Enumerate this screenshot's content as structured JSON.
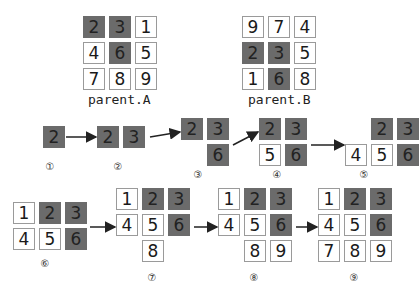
{
  "colors": {
    "highlight": "#6b6b6b",
    "plain": "#ffffff",
    "border": "#9a9a9a",
    "arrow": "#222222"
  },
  "parent_a": {
    "label": "parent.A",
    "grid": [
      [
        "2",
        "3",
        "1"
      ],
      [
        "4",
        "6",
        "5"
      ],
      [
        "7",
        "8",
        "9"
      ]
    ],
    "highlight": [
      [
        true,
        true,
        false
      ],
      [
        false,
        true,
        false
      ],
      [
        false,
        false,
        false
      ]
    ]
  },
  "parent_b": {
    "label": "parent.B",
    "grid": [
      [
        "9",
        "7",
        "4"
      ],
      [
        "2",
        "3",
        "5"
      ],
      [
        "1",
        "6",
        "8"
      ]
    ],
    "highlight": [
      [
        false,
        false,
        false
      ],
      [
        true,
        true,
        false
      ],
      [
        false,
        true,
        false
      ]
    ]
  },
  "steps": [
    {
      "marker": "①",
      "cells": [
        {
          "r": 0,
          "c": 0,
          "v": "2",
          "hl": true
        }
      ]
    },
    {
      "marker": "②",
      "cells": [
        {
          "r": 0,
          "c": 0,
          "v": "2",
          "hl": true
        },
        {
          "r": 0,
          "c": 1,
          "v": "3",
          "hl": true
        }
      ]
    },
    {
      "marker": "③",
      "cells": [
        {
          "r": 0,
          "c": 0,
          "v": "2",
          "hl": true
        },
        {
          "r": 0,
          "c": 1,
          "v": "3",
          "hl": true
        },
        {
          "r": 1,
          "c": 1,
          "v": "6",
          "hl": true
        }
      ]
    },
    {
      "marker": "④",
      "cells": [
        {
          "r": 0,
          "c": 0,
          "v": "2",
          "hl": true
        },
        {
          "r": 0,
          "c": 1,
          "v": "3",
          "hl": true
        },
        {
          "r": 1,
          "c": 0,
          "v": "5",
          "hl": false
        },
        {
          "r": 1,
          "c": 1,
          "v": "6",
          "hl": true
        }
      ]
    },
    {
      "marker": "⑤",
      "cells": [
        {
          "r": 0,
          "c": 1,
          "v": "2",
          "hl": true
        },
        {
          "r": 0,
          "c": 2,
          "v": "3",
          "hl": true
        },
        {
          "r": 1,
          "c": 0,
          "v": "4",
          "hl": false
        },
        {
          "r": 1,
          "c": 1,
          "v": "5",
          "hl": false
        },
        {
          "r": 1,
          "c": 2,
          "v": "6",
          "hl": true
        }
      ]
    },
    {
      "marker": "⑥",
      "cells": [
        {
          "r": 0,
          "c": 0,
          "v": "1",
          "hl": false
        },
        {
          "r": 0,
          "c": 1,
          "v": "2",
          "hl": true
        },
        {
          "r": 0,
          "c": 2,
          "v": "3",
          "hl": true
        },
        {
          "r": 1,
          "c": 0,
          "v": "4",
          "hl": false
        },
        {
          "r": 1,
          "c": 1,
          "v": "5",
          "hl": false
        },
        {
          "r": 1,
          "c": 2,
          "v": "6",
          "hl": true
        }
      ]
    },
    {
      "marker": "⑦",
      "cells": [
        {
          "r": 0,
          "c": 0,
          "v": "1",
          "hl": false
        },
        {
          "r": 0,
          "c": 1,
          "v": "2",
          "hl": true
        },
        {
          "r": 0,
          "c": 2,
          "v": "3",
          "hl": true
        },
        {
          "r": 1,
          "c": 0,
          "v": "4",
          "hl": false
        },
        {
          "r": 1,
          "c": 1,
          "v": "5",
          "hl": false
        },
        {
          "r": 1,
          "c": 2,
          "v": "6",
          "hl": true
        },
        {
          "r": 2,
          "c": 1,
          "v": "8",
          "hl": false
        }
      ]
    },
    {
      "marker": "⑧",
      "cells": [
        {
          "r": 0,
          "c": 0,
          "v": "1",
          "hl": false
        },
        {
          "r": 0,
          "c": 1,
          "v": "2",
          "hl": true
        },
        {
          "r": 0,
          "c": 2,
          "v": "3",
          "hl": true
        },
        {
          "r": 1,
          "c": 0,
          "v": "4",
          "hl": false
        },
        {
          "r": 1,
          "c": 1,
          "v": "5",
          "hl": false
        },
        {
          "r": 1,
          "c": 2,
          "v": "6",
          "hl": true
        },
        {
          "r": 2,
          "c": 1,
          "v": "8",
          "hl": false
        },
        {
          "r": 2,
          "c": 2,
          "v": "9",
          "hl": false
        }
      ]
    },
    {
      "marker": "⑨",
      "cells": [
        {
          "r": 0,
          "c": 0,
          "v": "1",
          "hl": false
        },
        {
          "r": 0,
          "c": 1,
          "v": "2",
          "hl": true
        },
        {
          "r": 0,
          "c": 2,
          "v": "3",
          "hl": true
        },
        {
          "r": 1,
          "c": 0,
          "v": "4",
          "hl": false
        },
        {
          "r": 1,
          "c": 1,
          "v": "5",
          "hl": false
        },
        {
          "r": 1,
          "c": 2,
          "v": "6",
          "hl": true
        },
        {
          "r": 2,
          "c": 0,
          "v": "7",
          "hl": false
        },
        {
          "r": 2,
          "c": 1,
          "v": "8",
          "hl": false
        },
        {
          "r": 2,
          "c": 2,
          "v": "9",
          "hl": false
        }
      ]
    }
  ]
}
